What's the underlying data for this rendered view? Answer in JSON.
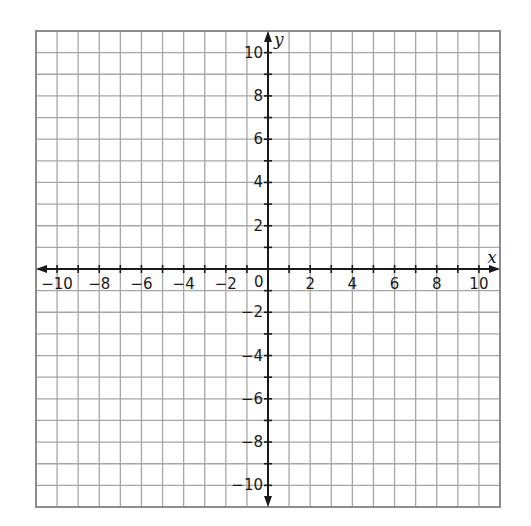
{
  "chart_data": {
    "type": "coordinate-grid",
    "title": "",
    "xlabel": "x",
    "ylabel": "y",
    "xlim": [
      -11,
      11
    ],
    "ylim": [
      -11,
      11
    ],
    "grid": true,
    "grid_step": 1,
    "x_ticks": [
      -10,
      -8,
      -6,
      -4,
      -2,
      2,
      4,
      6,
      8,
      10
    ],
    "y_ticks": [
      10,
      8,
      6,
      4,
      2,
      -2,
      -4,
      -6,
      -8,
      -10
    ],
    "origin_label": "0",
    "x_tick_labels": [
      "−10",
      "−8",
      "−6",
      "−4",
      "−2",
      "2",
      "4",
      "6",
      "8",
      "10"
    ],
    "y_tick_labels": [
      "10",
      "8",
      "6",
      "4",
      "2",
      "−2",
      "−4",
      "−6",
      "−8",
      "−10"
    ],
    "series": [],
    "colors": {
      "grid": "#a6a6a6",
      "axis": "#1a1a1a",
      "border": "#8c8c8c"
    }
  }
}
